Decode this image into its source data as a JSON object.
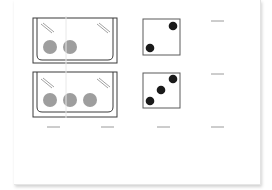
{
  "worksheet": {
    "rows": [
      {
        "tub": {
          "balls": 2
        },
        "die": {
          "pips": 2
        },
        "answer_blank": "",
        "label": "row-1"
      },
      {
        "tub": {
          "balls": 3
        },
        "die": {
          "pips": 3
        },
        "answer_blank": "",
        "label": "row-2"
      }
    ],
    "bottom_blanks": [
      "",
      "",
      "",
      ""
    ]
  },
  "colors": {
    "outline": "#3a3a3a",
    "ball": "#9e9e9e",
    "pip": "#1a1a1a",
    "blank_line": "#9a9a9a",
    "paper": "#ffffff"
  }
}
